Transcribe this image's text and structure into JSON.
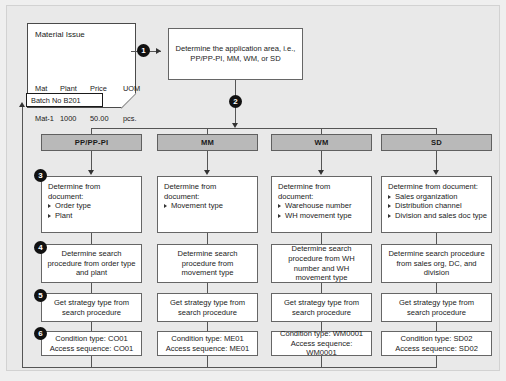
{
  "diagram": {
    "colors": {
      "background": "#e9e9e9",
      "header_fill": "#b9b9b9",
      "box_fill": "#ffffff",
      "line": "#555555",
      "bullet": "#111111"
    }
  },
  "document": {
    "title": "Material Issue",
    "table": {
      "headers": [
        "Mat",
        "Plant",
        "Price",
        "UOM"
      ],
      "rows": [
        [
          "Mat-1",
          "1000",
          "50.00",
          "pcs."
        ]
      ]
    },
    "batch_label": "Batch No B201"
  },
  "application_box": {
    "text": "Determine the application area, i.e., PP/PP-PI, MM, WM, or SD"
  },
  "steps": {
    "s1": "1",
    "s2": "2",
    "s3": "3",
    "s4": "4",
    "s5": "5",
    "s6": "6"
  },
  "columns": [
    {
      "header": "PP/PP-PI",
      "row3": {
        "lead": "Determine from document:",
        "items": [
          "Order type",
          "Plant"
        ]
      },
      "row4": "Determine search procedure from order type and plant",
      "row5": "Get strategy type from search procedure",
      "row6": {
        "condition": "Condition type: CO01",
        "access": "Access sequence: CO01"
      }
    },
    {
      "header": "MM",
      "row3": {
        "lead": "Determine from document:",
        "items": [
          "Movement type"
        ]
      },
      "row4": "Determine search procedure from movement type",
      "row5": "Get strategy type from search procedure",
      "row6": {
        "condition": "Condition type: ME01",
        "access": "Access sequence: ME01"
      }
    },
    {
      "header": "WM",
      "row3": {
        "lead": "Determine from document:",
        "items": [
          "Warehouse number",
          "WH movement type"
        ]
      },
      "row4": "Determine search procedure from WH number and WH movement type",
      "row5": "Get strategy type from search procedure",
      "row6": {
        "condition": "Condition type: WM0001",
        "access": "Access sequence: WM0001"
      }
    },
    {
      "header": "SD",
      "row3": {
        "lead": "Determine from document:",
        "items": [
          "Sales organization",
          "Distribution channel",
          "Division and sales doc type"
        ]
      },
      "row4": "Determine search procedure from sales org, DC, and division",
      "row5": "Get strategy type from search procedure",
      "row6": {
        "condition": "Condition type: SD02",
        "access": "Access sequence: SD02"
      }
    }
  ]
}
